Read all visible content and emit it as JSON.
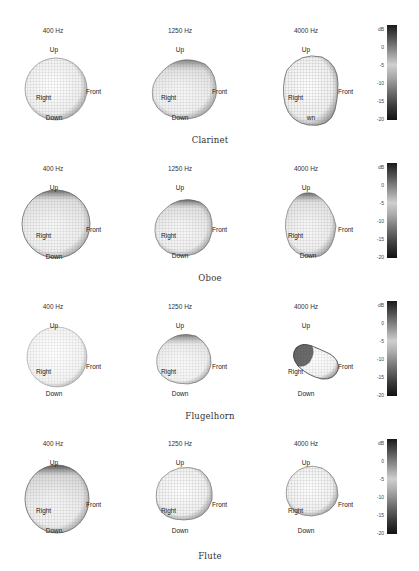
{
  "figure": {
    "colorbar": {
      "unit": "dB",
      "ticks": [
        "0",
        "-5",
        "-10",
        "-15",
        "-20"
      ],
      "range": [
        -20,
        3
      ],
      "colors": {
        "high": "#1a1a1a",
        "mid": "#cfcfcf",
        "low": "#111111"
      }
    },
    "direction_labels": {
      "up": "Up",
      "down": "Down",
      "right": "Right",
      "front": "Front"
    },
    "rows": [
      {
        "instrument": "Clarinet",
        "panels": [
          {
            "freq": "400 Hz",
            "down_label": "Down"
          },
          {
            "freq": "1250 Hz",
            "down_label": "Down"
          },
          {
            "freq": "4000 Hz",
            "down_label": "wn"
          }
        ]
      },
      {
        "instrument": "Oboe",
        "panels": [
          {
            "freq": "400 Hz",
            "down_label": "Down"
          },
          {
            "freq": "1250 Hz",
            "down_label": "Down"
          },
          {
            "freq": "4000 Hz",
            "down_label": "Down"
          }
        ]
      },
      {
        "instrument": "Flugelhorn",
        "panels": [
          {
            "freq": "400 Hz",
            "down_label": "Down"
          },
          {
            "freq": "1250 Hz",
            "down_label": "Down"
          },
          {
            "freq": "4000 Hz",
            "down_label": "Down"
          }
        ]
      },
      {
        "instrument": "Flute",
        "panels": [
          {
            "freq": "400 Hz",
            "down_label": "Down"
          },
          {
            "freq": "1250 Hz",
            "down_label": "Down"
          },
          {
            "freq": "4000 Hz",
            "down_label": "Down"
          }
        ]
      }
    ]
  }
}
